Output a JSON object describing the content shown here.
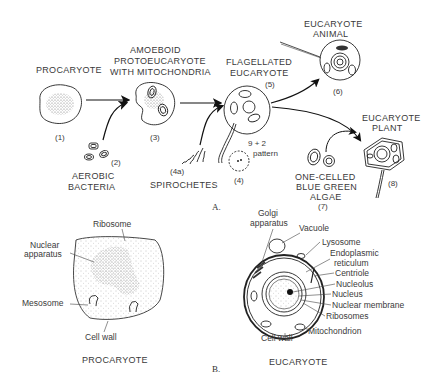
{
  "figure": {
    "panel_a": {
      "label": "A.",
      "stages": [
        {
          "id": "procaryote",
          "title": "PROCARYOTE",
          "number": "(1)"
        },
        {
          "id": "aerobic-bacteria",
          "title_line1": "AEROBIC",
          "title_line2": "BACTERIA",
          "number": "(2)"
        },
        {
          "id": "amoeboid",
          "title_line1": "AMOEBOID",
          "title_line2": "PROTOEUCARYOTE",
          "title_line3": "WITH MITOCHONDRIA",
          "number": "(3)"
        },
        {
          "id": "spirochetes",
          "title": "SPIROCHETES",
          "number": "(4a)"
        },
        {
          "id": "pattern",
          "title_line1": "9 + 2",
          "title_line2": "pattern",
          "number": "(4)"
        },
        {
          "id": "flagellated",
          "title_line1": "FLAGELLATED",
          "title_line2": "EUCARYOTE",
          "number": "(5)"
        },
        {
          "id": "animal",
          "title_line1": "EUCARYOTE",
          "title_line2": "ANIMAL",
          "number": "(6)"
        },
        {
          "id": "algae",
          "title_line1": "ONE-CELLED",
          "title_line2": "BLUE GREEN",
          "title_line3": "ALGAE",
          "number": "(7)"
        },
        {
          "id": "plant",
          "title_line1": "EUCARYOTE",
          "title_line2": "PLANT",
          "number": "(8)"
        }
      ]
    },
    "panel_b": {
      "label": "B.",
      "procaryote": {
        "caption": "PROCARYOTE",
        "parts": [
          "Ribosome",
          "Nuclear",
          "apparatus",
          "Mesosome",
          "Cell wall"
        ]
      },
      "eucaryote": {
        "caption": "EUCARYOTE",
        "parts": [
          "Golgi",
          "apparatus",
          "Vacuole",
          "Lysosome",
          "Endoplasmic",
          "reticulum",
          "Centriole",
          "Nucleolus",
          "Nucleus",
          "Nuclear membrane",
          "Ribosomes",
          "Mitochondrion",
          "Cell wall"
        ]
      }
    }
  }
}
